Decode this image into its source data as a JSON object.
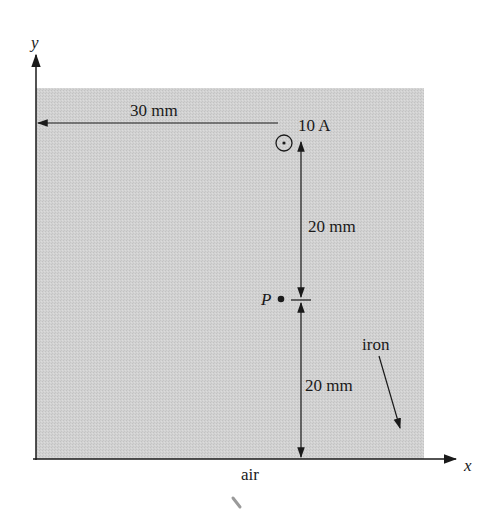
{
  "diagram": {
    "region_label": "iron",
    "outside_label": "air",
    "axes": {
      "x_label": "x",
      "y_label": "y"
    },
    "current": {
      "label": "10 A",
      "direction": "out-of-page"
    },
    "point": {
      "label": "P"
    },
    "dimensions": {
      "horizontal": "30 mm",
      "vertical_upper": "20 mm",
      "vertical_lower": "20 mm"
    },
    "colors": {
      "iron_fill": "#cfcfcf",
      "line": "#1a1a1a"
    }
  }
}
